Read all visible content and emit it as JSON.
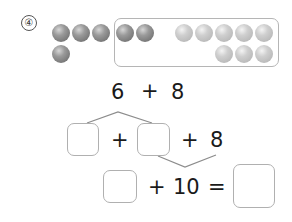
{
  "problem": {
    "number_label": "④",
    "balls": {
      "dark_count": 6,
      "light_count": 8,
      "dark_color": "#8a8a8a",
      "light_color": "#c4c4c4"
    },
    "line1": {
      "left": "6",
      "op": "+",
      "right": "8"
    },
    "line2": {
      "op1": "+",
      "op2": "+",
      "right": "8"
    },
    "line3": {
      "op": "+",
      "ten": "10",
      "eq": "="
    }
  }
}
